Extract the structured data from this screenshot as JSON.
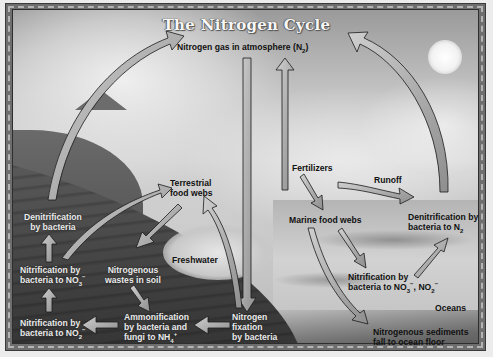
{
  "diagram": {
    "title": "The Nitrogen Cycle",
    "colors": {
      "frame": "#6e6e6e",
      "arrow_fill": "#a8a8a8",
      "arrow_outline": "#111111",
      "dark_text": "#111111",
      "light_text": "#eaeaea"
    },
    "labels": {
      "atmosphere": {
        "main": "Nitrogen gas in atmosphere (N",
        "sub": "2",
        "end": ")"
      },
      "denitrification_land": {
        "line1": "Denitrification",
        "line2": "by bacteria"
      },
      "terrestrial": {
        "line1": "Terrestrial",
        "line2": "food webs"
      },
      "nitrification_no3_land": {
        "line1": "Nitrification by",
        "line2_pre": "bacteria to NO",
        "sub": "3",
        "sup": "−"
      },
      "nitrogenous_wastes": {
        "line1": "Nitrogenous",
        "line2": "wastes in soil"
      },
      "freshwater": "Freshwater",
      "nitrification_no2_land": {
        "line1": "Nitrification by",
        "line2_pre": "bacteria to NO",
        "sub": "2",
        "sup": "−"
      },
      "ammonification": {
        "line1": "Ammonification",
        "line2": "by bacteria and",
        "line3_pre": "fungi to NH",
        "sub": "4",
        "sup": "+"
      },
      "nitrogen_fixation": {
        "line1": "Nitrogen",
        "line2": "fixation",
        "line3": "by bacteria"
      },
      "fertilizers": "Fertilizers",
      "runoff": "Runoff",
      "marine": "Marine food webs",
      "denitrification_ocean": {
        "line1": "Denitrification by",
        "line2_pre": "bacteria to N",
        "sub": "2"
      },
      "nitrification_ocean": {
        "line1": "Nitrification by",
        "line2_pre": "bacteria to NO",
        "sub1": "3",
        "sup1": "−",
        "mid": ", NO",
        "sub2": "2",
        "sup2": "−"
      },
      "oceans": "Oceans",
      "sediments": {
        "line1": "Nitrogenous sediments",
        "line2": "fall to ocean floor"
      }
    },
    "arrows": [
      {
        "from": "Denitrification by bacteria",
        "to": "Nitrogen gas in atmosphere (N2)"
      },
      {
        "from": "Nitrogen gas in atmosphere (N2)",
        "to": "Nitrogen fixation by bacteria"
      },
      {
        "from": "Fertilizers",
        "to": "Nitrogen gas in atmosphere (N2)"
      },
      {
        "from": "Denitrification by bacteria to N2",
        "to": "Nitrogen gas in atmosphere (N2)"
      },
      {
        "from": "Nitrification by bacteria to NO3-",
        "to": "Terrestrial food webs"
      },
      {
        "from": "Terrestrial food webs",
        "to": "Nitrogenous wastes in soil"
      },
      {
        "from": "Nitrogen fixation by bacteria",
        "to": "Terrestrial food webs"
      },
      {
        "from": "Nitrogenous wastes in soil",
        "to": "Ammonification by bacteria and fungi to NH4+"
      },
      {
        "from": "Nitrogen fixation by bacteria",
        "to": "Ammonification by bacteria and fungi to NH4+"
      },
      {
        "from": "Ammonification by bacteria and fungi to NH4+",
        "to": "Nitrification by bacteria to NO2-"
      },
      {
        "from": "Nitrification by bacteria to NO2-",
        "to": "Nitrification by bacteria to NO3-"
      },
      {
        "from": "Nitrification by bacteria to NO3-",
        "to": "Denitrification by bacteria"
      },
      {
        "from": "Fertilizers",
        "to": "Marine food webs"
      },
      {
        "from": "Fertilizers",
        "to": "Denitrification by bacteria to N2",
        "label": "Runoff"
      },
      {
        "from": "Marine food webs",
        "to": "Nitrification by bacteria to NO3-, NO2-"
      },
      {
        "from": "Nitrification by bacteria to NO3-, NO2-",
        "to": "Denitrification by bacteria to N2"
      },
      {
        "from": "Marine food webs",
        "to": "Nitrogenous sediments fall to ocean floor"
      }
    ]
  }
}
